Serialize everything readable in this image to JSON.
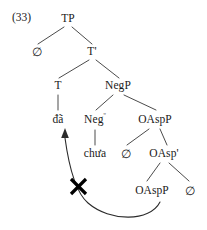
{
  "figure": {
    "example_number": "(33)",
    "caption_label": "",
    "type": "syntactic-tree"
  },
  "tree": {
    "nodes": [
      {
        "id": "tp",
        "label": "TP",
        "x": 68,
        "y": 19,
        "kind": "phrase"
      },
      {
        "id": "spec-tp",
        "label": "∅",
        "x": 37,
        "y": 52,
        "kind": "null"
      },
      {
        "id": "tbar",
        "label": "T'",
        "x": 92,
        "y": 52,
        "kind": "bar"
      },
      {
        "id": "t",
        "label": "T",
        "x": 58,
        "y": 86,
        "kind": "head"
      },
      {
        "id": "negp",
        "label": "NegP",
        "x": 118,
        "y": 86,
        "kind": "phrase"
      },
      {
        "id": "da",
        "label": "đã",
        "x": 58,
        "y": 120,
        "kind": "terminal"
      },
      {
        "id": "neg0",
        "label": "Neg",
        "sup": "º",
        "x": 95,
        "y": 120,
        "kind": "head"
      },
      {
        "id": "oaspp1",
        "label": "OAspP",
        "x": 155,
        "y": 120,
        "kind": "phrase"
      },
      {
        "id": "chua",
        "label": "chưa",
        "x": 95,
        "y": 154,
        "kind": "terminal"
      },
      {
        "id": "spec-oaspp",
        "label": "∅",
        "x": 126,
        "y": 154,
        "kind": "null"
      },
      {
        "id": "oaspbar",
        "label": "OAsp'",
        "x": 164,
        "y": 154,
        "kind": "bar"
      },
      {
        "id": "oaspp2",
        "label": "OAspP",
        "x": 152,
        "y": 191,
        "kind": "phrase"
      },
      {
        "id": "comp-oasp",
        "label": "∅",
        "x": 190,
        "y": 191,
        "kind": "null"
      }
    ],
    "edges": [
      {
        "from": "tp",
        "to": "spec-tp"
      },
      {
        "from": "tp",
        "to": "tbar"
      },
      {
        "from": "tbar",
        "to": "t"
      },
      {
        "from": "tbar",
        "to": "negp"
      },
      {
        "from": "t",
        "to": "da",
        "style": "vertical"
      },
      {
        "from": "negp",
        "to": "neg0"
      },
      {
        "from": "negp",
        "to": "oaspp1"
      },
      {
        "from": "neg0",
        "to": "chua",
        "style": "vertical"
      },
      {
        "from": "oaspp1",
        "to": "spec-oaspp"
      },
      {
        "from": "oaspp1",
        "to": "oaspbar"
      },
      {
        "from": "oaspbar",
        "to": "oaspp2"
      },
      {
        "from": "oaspbar",
        "to": "comp-oasp"
      }
    ]
  },
  "movement": {
    "label": "blocked-movement-arrow",
    "from_node": "oaspp2",
    "to_node": "da",
    "blocked": true,
    "block_marker": "×",
    "stroke_color": "#2b2b2b"
  },
  "colors": {
    "background": "#ffffff",
    "ink": "#1a1a1a",
    "line": "#2b2b2b",
    "block": "#000000"
  }
}
